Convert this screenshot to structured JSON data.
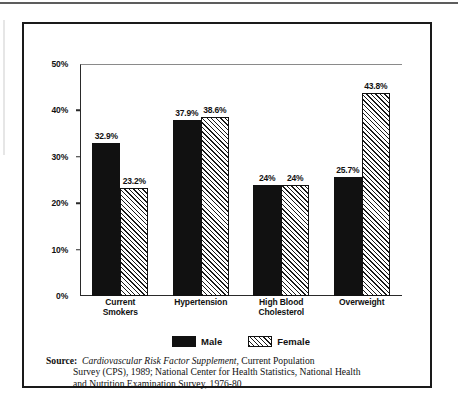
{
  "figure": {
    "chart_data": {
      "type": "bar",
      "title": "",
      "xlabel": "",
      "ylabel": "",
      "ylim": [
        0,
        50
      ],
      "y_unit": "%",
      "grid": false,
      "legend_position": "bottom-center",
      "y_ticks": [
        "0%",
        "10%",
        "20%",
        "30%",
        "40%",
        "50%"
      ],
      "y_tick_values": [
        0,
        10,
        20,
        30,
        40,
        50
      ],
      "categories": [
        "Current\nSmokers",
        "Hypertension",
        "High Blood\nCholesterol",
        "Overweight"
      ],
      "category_lines": [
        [
          "Current",
          "Smokers"
        ],
        [
          "Hypertension"
        ],
        [
          "High Blood",
          "Cholesterol"
        ],
        [
          "Overweight"
        ]
      ],
      "series": [
        {
          "name": "Male",
          "fill": "solid-black",
          "values": [
            32.9,
            37.9,
            24,
            25.7
          ],
          "labels": [
            "32.9%",
            "37.9%",
            "24%",
            "25.7%"
          ]
        },
        {
          "name": "Female",
          "fill": "diagonal-hatch",
          "values": [
            23.2,
            38.6,
            24,
            43.8
          ],
          "labels": [
            "23.2%",
            "38.6%",
            "24%",
            "43.8%"
          ]
        }
      ]
    },
    "legend": [
      {
        "label": "Male",
        "swatch": "solid-black"
      },
      {
        "label": "Female",
        "swatch": "diagonal-hatch"
      }
    ],
    "source": {
      "prefix": "Source:",
      "title_italic": "Cardiovascular Risk Factor Supplement",
      "line1_tail": ", Current Population",
      "line2": "Survey (CPS), 1989; National Center for Health Statistics, National Health",
      "line3": "and Nutrition Examination Survey, 1976-80"
    },
    "colors": {
      "male_fill": "#111111",
      "female_fill": "#ffffff",
      "hatch": "#1a1a1a",
      "axis": "#2a2a2a",
      "border": "#1a1a1a",
      "text": "#111111",
      "background": "#ffffff"
    }
  }
}
